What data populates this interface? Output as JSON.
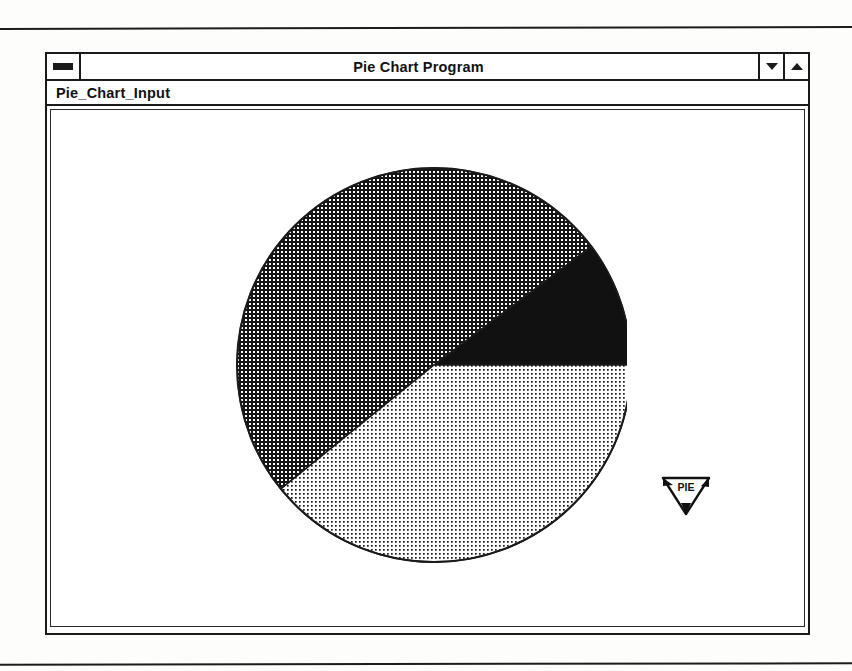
{
  "window": {
    "title": "Pie Chart Program",
    "menu_button_icon": "window-menu-icon",
    "buttons": [
      {
        "name": "minimize-button",
        "icon": "triangle-down-icon",
        "label": "▼"
      },
      {
        "name": "maximize-button",
        "icon": "triangle-up-icon",
        "label": "▲"
      }
    ]
  },
  "menu": {
    "items": [
      {
        "label": "Pie_Chart_Input"
      }
    ]
  },
  "cursor": {
    "label": "PIE",
    "icon": "pie-wedge-cursor-icon"
  },
  "colors": {
    "ink": "#1a1a1a",
    "paper": "#ffffff",
    "segment_black": "#111111",
    "segment_crosshatch": "#4a4a4a",
    "segment_dots": "#cfcfcf"
  },
  "chart_data": {
    "type": "pie",
    "title": "",
    "legend_position": "none",
    "grid": false,
    "center": {
      "x": 207,
      "y": 220
    },
    "radius": 197,
    "start_angle_deg": 0,
    "direction": "counterclockwise",
    "categories": [
      "Slice 1",
      "Slice 2",
      "Slice 3"
    ],
    "values": [
      37,
      182,
      141
    ],
    "percentages": [
      10.3,
      50.6,
      39.1
    ],
    "slices": [
      {
        "label": "Slice 1",
        "value": 37,
        "percent": 10.3,
        "start_angle_deg": 0,
        "end_angle_deg": 37,
        "fill": "solid-black",
        "color": "#111111"
      },
      {
        "label": "Slice 2",
        "value": 182,
        "percent": 50.6,
        "start_angle_deg": 37,
        "end_angle_deg": 219,
        "fill": "dense-crosshatch",
        "color": "#4a4a4a"
      },
      {
        "label": "Slice 3",
        "value": 141,
        "percent": 39.1,
        "start_angle_deg": 219,
        "end_angle_deg": 360,
        "fill": "fine-dots",
        "color": "#cfcfcf"
      }
    ]
  }
}
